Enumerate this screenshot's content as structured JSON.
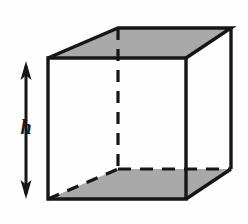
{
  "figure": {
    "background_color": "#fefefe",
    "stroke_color": "#161616",
    "shade_color": "#a9a9a9",
    "labels": {
      "height": "h"
    },
    "annotations": {
      "dimension_arrow": "double-headed-vertical-arrow",
      "arrow_top_y": 62,
      "arrow_bottom_y": 198
    },
    "geometry": {
      "type": "cube-wireframe-oblique",
      "front_face": [
        [
          48,
          58
        ],
        [
          186,
          58
        ],
        [
          186,
          199
        ],
        [
          48,
          199
        ]
      ],
      "back_face": [
        [
          118,
          28
        ],
        [
          231,
          28
        ],
        [
          231,
          169
        ],
        [
          118,
          169
        ]
      ],
      "top_face_shaded": [
        [
          48,
          58
        ],
        [
          118,
          28
        ],
        [
          231,
          28
        ],
        [
          186,
          58
        ]
      ],
      "bottom_face_shaded": [
        [
          48,
          199
        ],
        [
          118,
          169
        ],
        [
          231,
          169
        ],
        [
          186,
          199
        ]
      ],
      "hidden_edges_dashed": [
        [
          [
            118,
            28
          ],
          [
            118,
            169
          ]
        ],
        [
          [
            48,
            199
          ],
          [
            118,
            169
          ]
        ],
        [
          [
            118,
            169
          ],
          [
            231,
            169
          ]
        ]
      ]
    }
  }
}
